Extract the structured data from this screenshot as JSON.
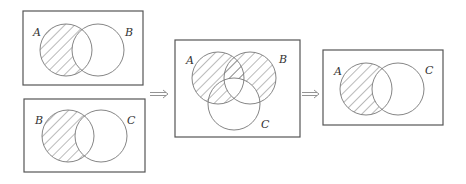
{
  "diagrams": [
    {
      "id": "top-left",
      "box": {
        "x": 23,
        "y": 11,
        "w": 120,
        "h": 74
      },
      "circles": [
        {
          "label": "A",
          "cx": 66,
          "cy": 50,
          "r": 26,
          "label_x": 33,
          "label_y": 36
        },
        {
          "label": "B",
          "cx": 98,
          "cy": 50,
          "r": 26,
          "label_x": 125,
          "label_y": 36
        }
      ],
      "shaded_region": "A minus B"
    },
    {
      "id": "bottom-left",
      "box": {
        "x": 24,
        "y": 99,
        "w": 121,
        "h": 73
      },
      "circles": [
        {
          "label": "B",
          "cx": 68,
          "cy": 136,
          "r": 26,
          "label_x": 35,
          "label_y": 124
        },
        {
          "label": "C",
          "cx": 101,
          "cy": 136,
          "r": 26,
          "label_x": 127,
          "label_y": 124
        }
      ],
      "shaded_region": "B minus C"
    },
    {
      "id": "middle",
      "box": {
        "x": 175,
        "y": 40,
        "w": 125,
        "h": 97
      },
      "circles": [
        {
          "label": "A",
          "cx": 218,
          "cy": 78,
          "r": 26,
          "label_x": 186,
          "label_y": 64
        },
        {
          "label": "B",
          "cx": 250,
          "cy": 78,
          "r": 26,
          "label_x": 279,
          "label_y": 63
        },
        {
          "label": "C",
          "cx": 234,
          "cy": 104,
          "r": 26,
          "label_x": 261,
          "label_y": 128
        }
      ],
      "shaded_region": "(A minus C) union (B minus C) union (A∩C minus B)"
    },
    {
      "id": "right",
      "box": {
        "x": 323,
        "y": 50,
        "w": 120,
        "h": 75
      },
      "circles": [
        {
          "label": "A",
          "cx": 366,
          "cy": 89,
          "r": 26,
          "label_x": 334,
          "label_y": 75
        },
        {
          "label": "C",
          "cx": 398,
          "cy": 89,
          "r": 26,
          "label_x": 425,
          "label_y": 74
        }
      ],
      "shaded_region": "A minus C"
    }
  ],
  "arrows": [
    {
      "symbol": "⟹",
      "x1": 150,
      "x2": 168,
      "y": 94
    },
    {
      "symbol": "⟹",
      "x1": 302,
      "x2": 319,
      "y": 94
    }
  ]
}
